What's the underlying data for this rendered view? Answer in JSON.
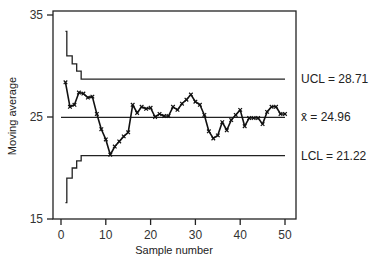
{
  "chart_data": {
    "type": "line",
    "title": "",
    "xlabel": "Sample number",
    "ylabel": "Moving average",
    "xlim": [
      0,
      50
    ],
    "ylim": [
      15,
      35
    ],
    "xticks": [
      0,
      10,
      20,
      30,
      40,
      50
    ],
    "yticks": [
      15,
      25,
      35
    ],
    "grid": false,
    "x": [
      1,
      2,
      3,
      4,
      5,
      6,
      7,
      8,
      9,
      10,
      11,
      12,
      13,
      14,
      15,
      16,
      17,
      18,
      19,
      20,
      21,
      22,
      23,
      24,
      25,
      26,
      27,
      28,
      29,
      30,
      31,
      32,
      33,
      34,
      35,
      36,
      37,
      38,
      39,
      40,
      41,
      42,
      43,
      44,
      45,
      46,
      47,
      48,
      49,
      50
    ],
    "series": [
      {
        "name": "Moving average",
        "marker": "x",
        "values": [
          28.4,
          26.0,
          26.2,
          27.4,
          27.3,
          26.9,
          27.0,
          25.3,
          23.8,
          22.8,
          21.3,
          22.1,
          22.6,
          23.1,
          23.5,
          26.2,
          25.4,
          26.0,
          25.8,
          25.9,
          25.0,
          25.3,
          25.1,
          25.1,
          26.0,
          25.7,
          26.3,
          26.7,
          27.2,
          26.5,
          26.2,
          25.2,
          23.6,
          22.9,
          23.2,
          24.5,
          23.7,
          24.7,
          25.2,
          25.7,
          24.1,
          24.9,
          24.9,
          24.9,
          24.3,
          25.5,
          26.0,
          26.0,
          25.3,
          25.3
        ]
      }
    ],
    "control_limits": {
      "center": {
        "label": "x̄ = 24.96",
        "value": 24.96
      },
      "ucl": {
        "label": "UCL = 28.71",
        "value": 28.71,
        "steps": [
          [
            1,
            33.4
          ],
          [
            2,
            31.0
          ],
          [
            3,
            30.2
          ],
          [
            4,
            29.5
          ],
          [
            5,
            28.71
          ],
          [
            50,
            28.71
          ]
        ]
      },
      "lcl": {
        "label": "LCL = 21.22",
        "value": 21.22,
        "steps": [
          [
            1,
            16.6
          ],
          [
            2,
            19.0
          ],
          [
            3,
            20.0
          ],
          [
            4,
            20.7
          ],
          [
            5,
            21.22
          ],
          [
            50,
            21.22
          ]
        ]
      }
    }
  }
}
